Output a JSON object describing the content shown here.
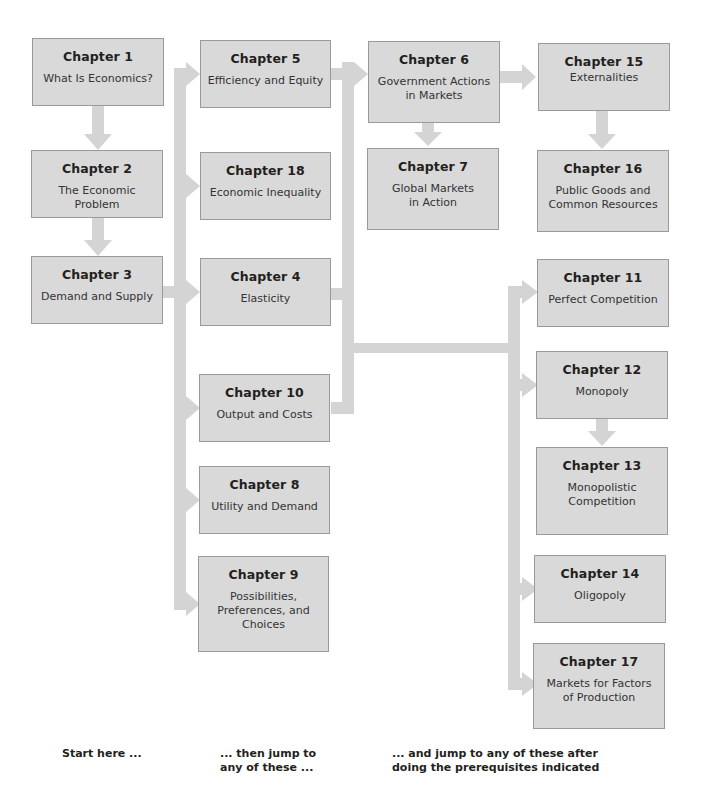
{
  "colors": {
    "box_fill": "#d9d9d9",
    "box_border": "#9a9a9a",
    "arrow": "#d4d4d4"
  },
  "chapters": {
    "ch1": {
      "label": "Chapter 1",
      "title": "What Is Economics?"
    },
    "ch2": {
      "label": "Chapter 2",
      "title": "The Economic Problem"
    },
    "ch3": {
      "label": "Chapter 3",
      "title": "Demand and Supply"
    },
    "ch5": {
      "label": "Chapter 5",
      "title": "Efficiency and Equity"
    },
    "ch18": {
      "label": "Chapter 18",
      "title": "Economic Inequality"
    },
    "ch4": {
      "label": "Chapter 4",
      "title": "Elasticity"
    },
    "ch10": {
      "label": "Chapter 10",
      "title": "Output and Costs"
    },
    "ch8": {
      "label": "Chapter 8",
      "title": "Utility and Demand"
    },
    "ch9": {
      "label": "Chapter 9",
      "title": "Possibilities,\nPreferences, and\nChoices"
    },
    "ch6": {
      "label": "Chapter 6",
      "title": "Government Actions\nin Markets"
    },
    "ch7": {
      "label": "Chapter 7",
      "title": "Global Markets\nin Action"
    },
    "ch15": {
      "label": "Chapter 15",
      "title": "Externalities"
    },
    "ch16": {
      "label": "Chapter 16",
      "title": "Public Goods and\nCommon Resources"
    },
    "ch11": {
      "label": "Chapter 11",
      "title": "Perfect Competition"
    },
    "ch12": {
      "label": "Chapter 12",
      "title": "Monopoly"
    },
    "ch13": {
      "label": "Chapter 13",
      "title": "Monopolistic\nCompetition"
    },
    "ch14": {
      "label": "Chapter 14",
      "title": "Oligopoly"
    },
    "ch17": {
      "label": "Chapter 17",
      "title": "Markets for Factors\nof Production"
    }
  },
  "captions": {
    "start": "Start here ...",
    "then": "... then jump to\nany of these ...",
    "and": "... and jump to any of these after\ndoing the prerequisites indicated"
  },
  "edges": [
    [
      "ch1",
      "ch2"
    ],
    [
      "ch2",
      "ch3"
    ],
    [
      "ch3",
      "ch5"
    ],
    [
      "ch3",
      "ch18"
    ],
    [
      "ch3",
      "ch4"
    ],
    [
      "ch3",
      "ch10"
    ],
    [
      "ch3",
      "ch8"
    ],
    [
      "ch3",
      "ch9"
    ],
    [
      "ch5",
      "ch6"
    ],
    [
      "ch4",
      "ch6"
    ],
    [
      "ch10",
      "ch6"
    ],
    [
      "ch6",
      "ch7"
    ],
    [
      "ch6",
      "ch15"
    ],
    [
      "ch15",
      "ch16"
    ],
    [
      "ch4",
      "ch11"
    ],
    [
      "ch10",
      "ch11"
    ],
    [
      "ch4",
      "ch12"
    ],
    [
      "ch10",
      "ch12"
    ],
    [
      "ch12",
      "ch13"
    ],
    [
      "ch4",
      "ch14"
    ],
    [
      "ch10",
      "ch14"
    ],
    [
      "ch4",
      "ch17"
    ],
    [
      "ch10",
      "ch17"
    ]
  ]
}
